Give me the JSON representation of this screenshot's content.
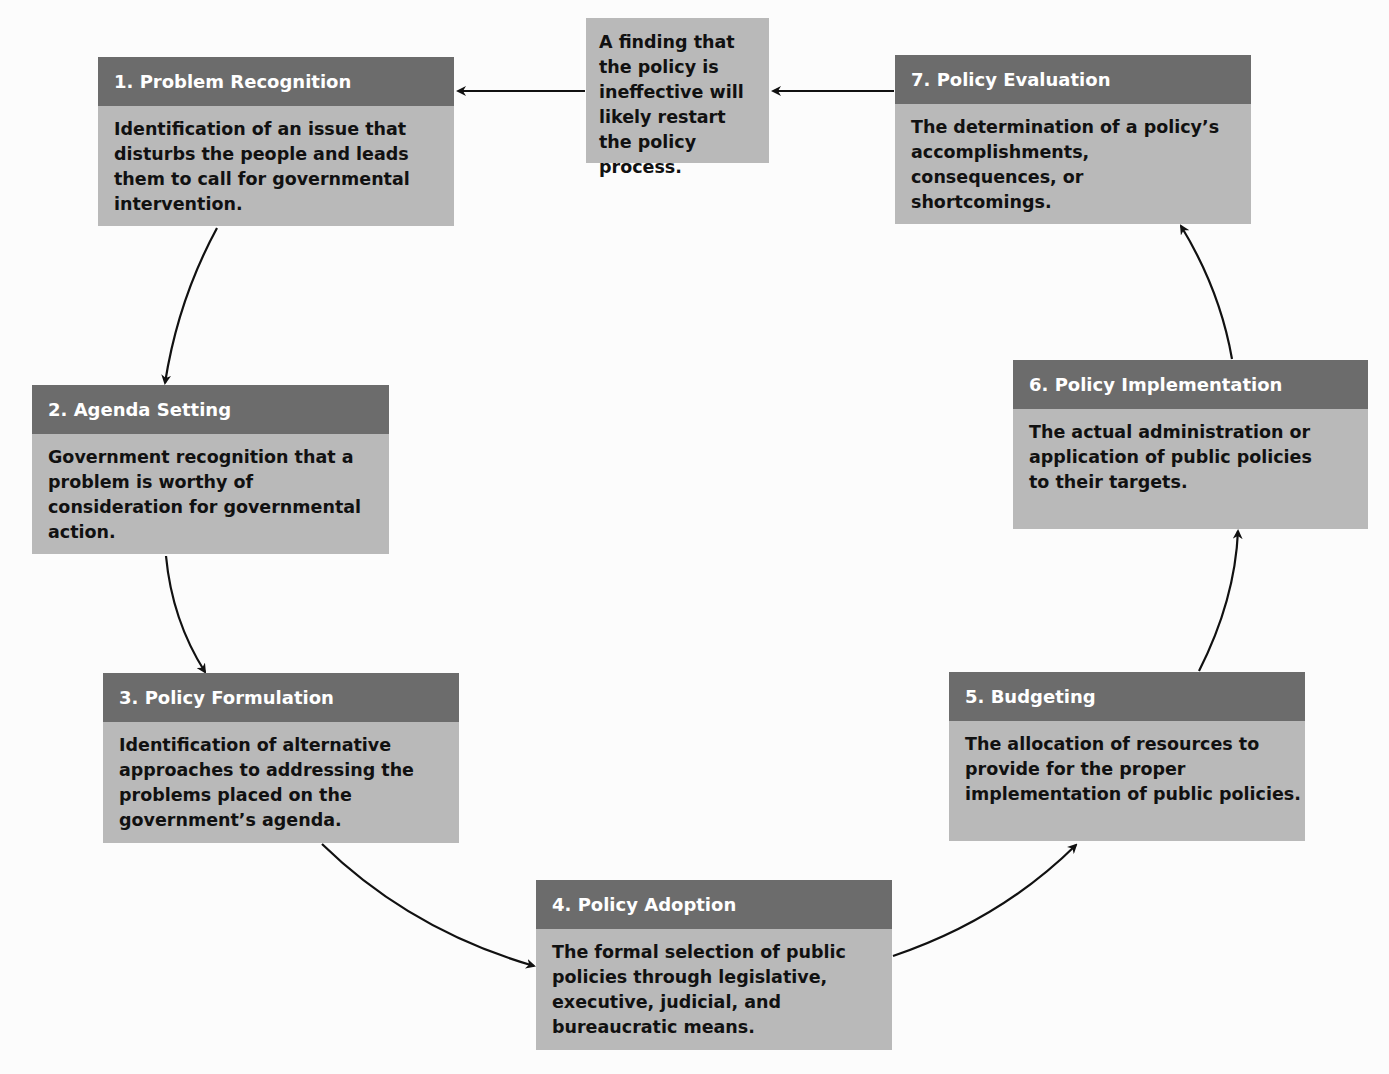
{
  "diagram": {
    "type": "cycle",
    "colors": {
      "header_bg": "#6c6c6c",
      "body_bg": "#b9b9b9",
      "header_text": "#ffffff",
      "body_text": "#111111",
      "arrow": "#111111"
    },
    "note": {
      "text": "A finding that the policy is ineffective will likely restart the policy process."
    },
    "stages": [
      {
        "id": 1,
        "title": "1. Problem Recognition",
        "description": "Identification of an issue that disturbs the people and leads them to call for governmental intervention."
      },
      {
        "id": 2,
        "title": "2. Agenda Setting",
        "description": "Government recognition that a problem is worthy of consideration for governmental action."
      },
      {
        "id": 3,
        "title": "3. Policy Formulation",
        "description": "Identification of alternative approaches to addressing the problems placed on the government’s agenda."
      },
      {
        "id": 4,
        "title": "4. Policy Adoption",
        "description": "The formal selection of public policies through legislative, executive, judicial, and bureaucratic means."
      },
      {
        "id": 5,
        "title": "5. Budgeting",
        "description": "The allocation of resources to provide for the proper implementation of public policies."
      },
      {
        "id": 6,
        "title": "6. Policy Implementation",
        "description": "The actual administration or application of public policies to their targets."
      },
      {
        "id": 7,
        "title": "7. Policy Evaluation",
        "description": "The determination of a policy’s accomplishments, consequences, or shortcomings."
      }
    ],
    "edges": [
      {
        "from": 1,
        "to": 2
      },
      {
        "from": 2,
        "to": 3
      },
      {
        "from": 3,
        "to": 4
      },
      {
        "from": 4,
        "to": 5
      },
      {
        "from": 5,
        "to": 6
      },
      {
        "from": 6,
        "to": 7
      },
      {
        "from": 7,
        "to": "note"
      },
      {
        "from": "note",
        "to": 1
      }
    ]
  }
}
